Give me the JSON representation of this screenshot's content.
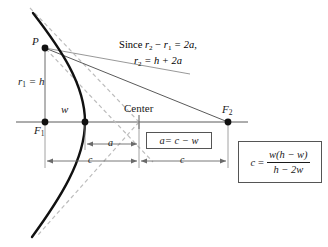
{
  "figure": {
    "type": "geometry-diagram",
    "background": "#ffffff",
    "ink": "#1a1a1a",
    "dashed_color": "#b9b9b9",
    "thin_color": "#555555"
  },
  "points": [
    {
      "id": "P",
      "label": "P",
      "x": 45,
      "y": 48,
      "marker": "filled-dot"
    },
    {
      "id": "F1",
      "label": "F",
      "sub": "1",
      "x": 45,
      "y": 122,
      "marker": "filled-dot"
    },
    {
      "id": "vertex",
      "label": "",
      "x": 85,
      "y": 122,
      "marker": "filled-dot"
    },
    {
      "id": "center",
      "label": "Center",
      "x": 139,
      "y": 122,
      "marker": "tick"
    },
    {
      "id": "F2",
      "label": "F",
      "sub": "2",
      "x": 228,
      "y": 122,
      "marker": "filled-dot"
    }
  ],
  "labels": {
    "p": "P",
    "f1_base": "F",
    "f1_sub": "1",
    "f2_base": "F",
    "f2_sub": "2",
    "center": "Center",
    "r1_eq_h_base": "r",
    "r1_eq_h_sub": "1",
    "r1_eq_h_rest": " = h",
    "w": "w",
    "a": "a",
    "c_left": "c",
    "c_right": "c"
  },
  "note": {
    "line1_pre": "Since ",
    "line1_r2": "r",
    "line1_r2sub": "2",
    "line1_mid": " − ",
    "line1_r1": "r",
    "line1_r1sub": "1",
    "line1_post": " = 2a,",
    "line2_r2": "r",
    "line2_r2sub": "2",
    "line2_post": " = h + 2a"
  },
  "boxes": [
    {
      "id": "box-a",
      "kind": "inline",
      "text_lhs": "a",
      "text_eq": " = c − w",
      "x": 146,
      "y": 134,
      "width": 66,
      "height": 16
    },
    {
      "id": "box-c",
      "kind": "fraction",
      "lhs": "c",
      "eq": "=",
      "numerator": "w(h − w)",
      "denominator": "h − 2w",
      "x": 238,
      "y": 141,
      "width": 84,
      "height": 42
    }
  ],
  "dimensions": [
    {
      "id": "dim-a",
      "label": "a",
      "from_x": 85,
      "to_x": 139,
      "y": 144
    },
    {
      "id": "dim-c-left",
      "label": "c",
      "from_x": 45,
      "to_x": 139,
      "y": 161
    },
    {
      "id": "dim-c-right",
      "label": "c",
      "from_x": 139,
      "to_x": 228,
      "y": 161
    }
  ],
  "axis": {
    "from_x": 16,
    "to_x": 248,
    "y": 122
  },
  "curve": {
    "kind": "hyperbola-branch",
    "opens": "left",
    "vertex_x": 85,
    "vertex_y": 122,
    "top_x": 33,
    "top_y": 13,
    "bottom_x": 32,
    "bottom_y": 237
  },
  "asymptotes": [
    {
      "id": "asymptote-upper",
      "from_x": 30,
      "from_y": 8,
      "to_x": 139,
      "to_y": 122,
      "style": "dashed"
    },
    {
      "id": "asymptote-lower",
      "from_x": 139,
      "from_y": 122,
      "to_x": 38,
      "to_y": 236,
      "style": "dashed"
    },
    {
      "id": "ray-p-center",
      "from_x": 45,
      "from_y": 48,
      "to_x": 152,
      "to_y": 160,
      "style": "dashed"
    }
  ],
  "rays": [
    {
      "id": "ray-p-f2",
      "from_x": 45,
      "from_y": 48,
      "to_x": 228,
      "to_y": 122,
      "style": "solid"
    },
    {
      "id": "ray-p-f1",
      "from_x": 45,
      "from_y": 48,
      "to_x": 45,
      "to_y": 122,
      "style": "solid"
    },
    {
      "id": "ray-p-right",
      "from_x": 45,
      "from_y": 48,
      "to_x": 186,
      "to_y": 72,
      "style": "solid"
    }
  ]
}
